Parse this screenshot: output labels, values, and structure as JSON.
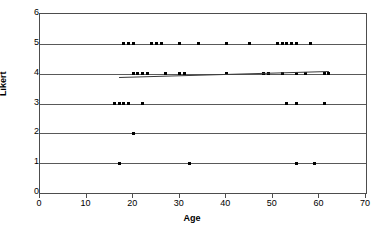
{
  "chart_data": {
    "type": "scatter",
    "title": "",
    "xlabel": "Age",
    "ylabel": "Likert",
    "xlim": [
      0,
      70
    ],
    "ylim": [
      0,
      6
    ],
    "xticks": [
      0,
      10,
      20,
      30,
      40,
      50,
      60,
      70
    ],
    "yticks": [
      0,
      1,
      2,
      3,
      4,
      5,
      6
    ],
    "grid": "horizontal",
    "legend": "none",
    "marker": "square",
    "marker_color": "#000000",
    "points": [
      {
        "x": 17,
        "y": 1
      },
      {
        "x": 32,
        "y": 1
      },
      {
        "x": 55,
        "y": 1
      },
      {
        "x": 59,
        "y": 1
      },
      {
        "x": 20,
        "y": 2
      },
      {
        "x": 16,
        "y": 3
      },
      {
        "x": 17,
        "y": 3
      },
      {
        "x": 18,
        "y": 3
      },
      {
        "x": 19,
        "y": 3
      },
      {
        "x": 22,
        "y": 3
      },
      {
        "x": 53,
        "y": 3
      },
      {
        "x": 55,
        "y": 3
      },
      {
        "x": 61,
        "y": 3
      },
      {
        "x": 20,
        "y": 4
      },
      {
        "x": 21,
        "y": 4
      },
      {
        "x": 22,
        "y": 4
      },
      {
        "x": 23,
        "y": 4
      },
      {
        "x": 27,
        "y": 4
      },
      {
        "x": 30,
        "y": 4
      },
      {
        "x": 31,
        "y": 4
      },
      {
        "x": 40,
        "y": 4
      },
      {
        "x": 48,
        "y": 4
      },
      {
        "x": 49,
        "y": 4
      },
      {
        "x": 52,
        "y": 4
      },
      {
        "x": 55,
        "y": 4
      },
      {
        "x": 57,
        "y": 4
      },
      {
        "x": 61,
        "y": 4
      },
      {
        "x": 62,
        "y": 4
      },
      {
        "x": 18,
        "y": 5
      },
      {
        "x": 19,
        "y": 5
      },
      {
        "x": 20,
        "y": 5
      },
      {
        "x": 24,
        "y": 5
      },
      {
        "x": 25,
        "y": 5
      },
      {
        "x": 26,
        "y": 5
      },
      {
        "x": 30,
        "y": 5
      },
      {
        "x": 34,
        "y": 5
      },
      {
        "x": 40,
        "y": 5
      },
      {
        "x": 45,
        "y": 5
      },
      {
        "x": 51,
        "y": 5
      },
      {
        "x": 52,
        "y": 5
      },
      {
        "x": 53,
        "y": 5
      },
      {
        "x": 54,
        "y": 5
      },
      {
        "x": 55,
        "y": 5
      },
      {
        "x": 58,
        "y": 5
      }
    ],
    "trendline": {
      "x_start": 17,
      "y_start": 3.88,
      "x_end": 62,
      "y_end": 4.08,
      "color": "#3a3a3a"
    }
  }
}
